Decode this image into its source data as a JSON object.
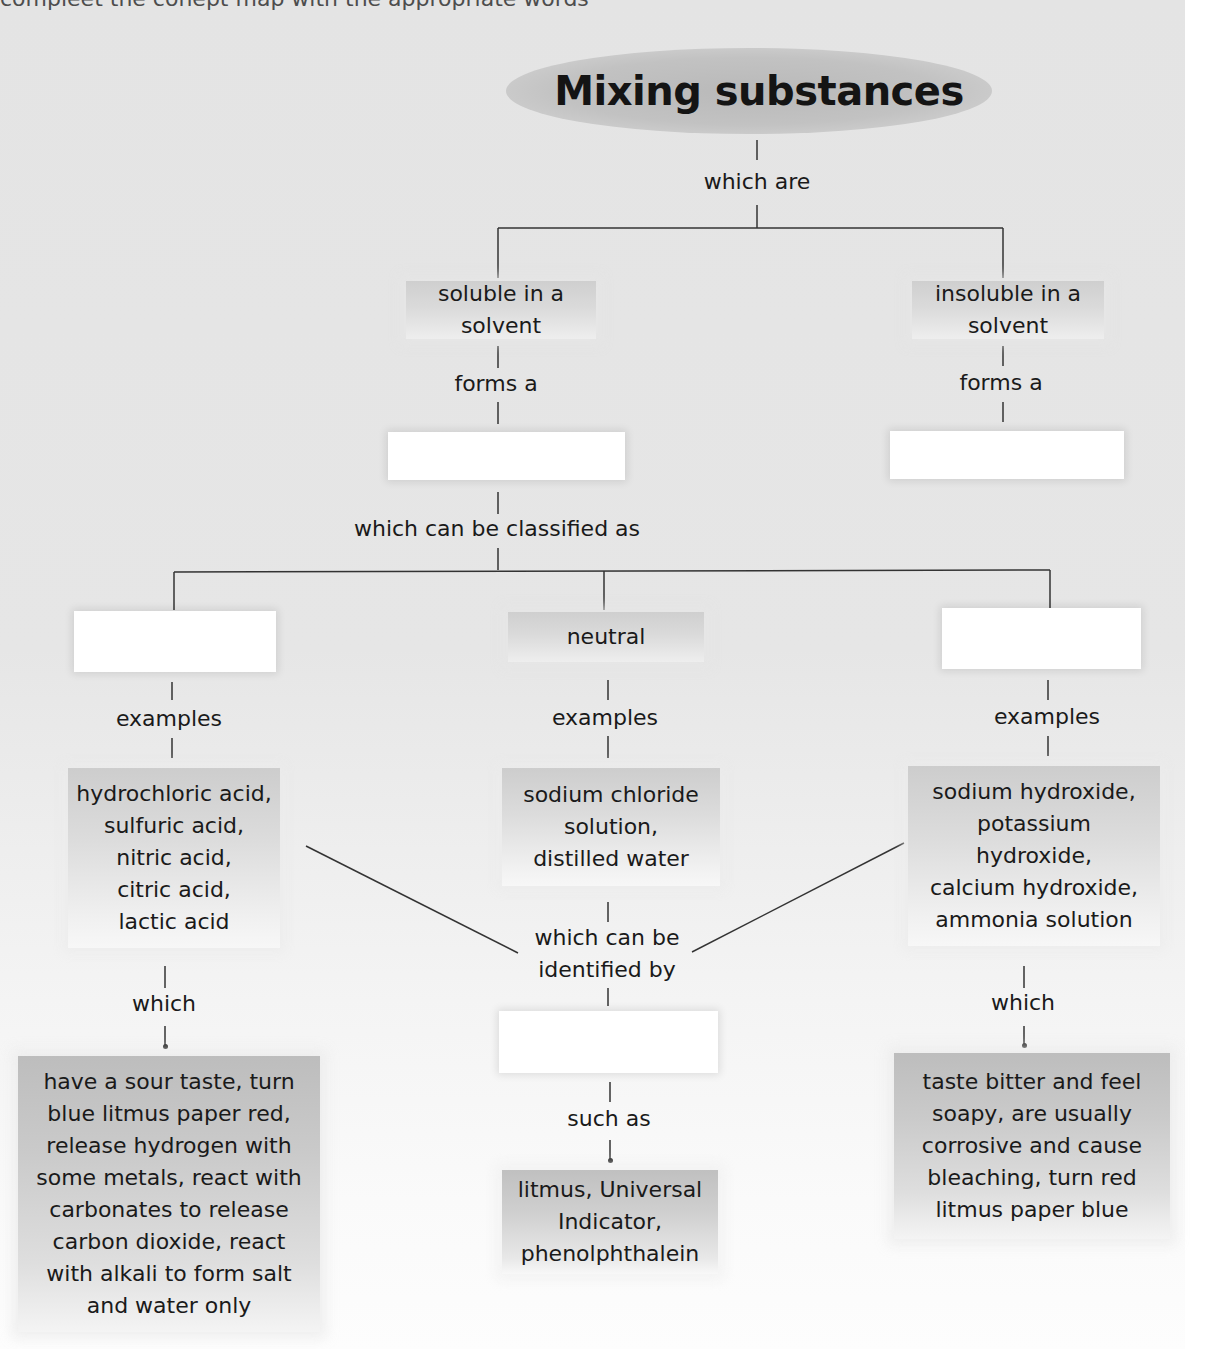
{
  "diagram": {
    "partial_header_text": "compleet the conept map with the appropriate words",
    "title": "Mixing substances",
    "link_which_are": "which are",
    "branch_soluble": {
      "label": "soluble in a\nsolvent",
      "line1": "soluble in a",
      "line2": "solvent",
      "link": "forms a",
      "blank_box": ""
    },
    "branch_insoluble": {
      "label": "insoluble in a\nsolvent",
      "line1": "insoluble in a",
      "line2": "solvent",
      "link": "forms a",
      "blank_box": ""
    },
    "link_classified": "which can be classified as",
    "categories": [
      {
        "label": "",
        "blank": true,
        "link_examples": "examples",
        "examples": [
          "hydrochloric acid,",
          "sulfuric acid,",
          "nitric acid,",
          "citric acid,",
          "lactic acid"
        ],
        "link_which": "which",
        "properties": [
          "have a sour taste, turn",
          "blue litmus paper red,",
          "release hydrogen with",
          "some metals, react with",
          "carbonates to release",
          "carbon dioxide, react",
          "with alkali to form salt",
          "and water only"
        ]
      },
      {
        "label": "neutral",
        "blank": false,
        "link_examples": "examples",
        "examples": [
          "sodium chloride",
          "solution,",
          "distilled water"
        ]
      },
      {
        "label": "",
        "blank": true,
        "link_examples": "examples",
        "examples": [
          "sodium hydroxide,",
          "potassium",
          "hydroxide,",
          "calcium hydroxide,",
          "ammonia solution"
        ],
        "link_which": "which",
        "properties": [
          "taste bitter and feel",
          "soapy, are usually",
          "corrosive and cause",
          "bleaching, turn red",
          "litmus paper blue"
        ]
      }
    ],
    "link_identified": [
      "which can be",
      "identified by"
    ],
    "identifier_blank": "",
    "link_such_as": "such as",
    "indicators": [
      "litmus, Universal",
      "Indicator,",
      "phenolphthalein"
    ]
  }
}
